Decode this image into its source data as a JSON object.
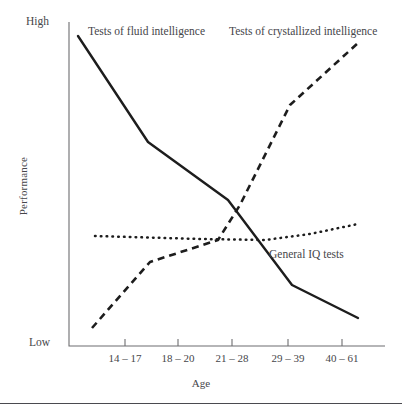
{
  "chart_data": {
    "type": "line",
    "title": "",
    "xlabel": "Age",
    "ylabel": "Performance",
    "categories": [
      "14 – 17",
      "18 – 20",
      "21 – 28",
      "29 – 39",
      "40 – 61"
    ],
    "y_axis_ticks": [
      "High",
      "Low"
    ],
    "ylim": [
      0,
      100
    ],
    "grid": false,
    "legend": "inline-annotations",
    "series": [
      {
        "name": "Tests of fluid intelligence",
        "style": "solid",
        "color": "#1d1d1d",
        "annotation": "Tests of fluid intelligence",
        "values": [
          96,
          76,
          52,
          26,
          14
        ],
        "points": [
          {
            "x": 78,
            "y": 36
          },
          {
            "x": 148,
            "y": 142
          },
          {
            "x": 228,
            "y": 200
          },
          {
            "x": 292,
            "y": 285
          },
          {
            "x": 358,
            "y": 318
          }
        ]
      },
      {
        "name": "Tests of crystallized intelligence",
        "style": "dashed",
        "color": "#1d1d1d",
        "annotation": "Tests of crystallized intelligence",
        "values": [
          6,
          27,
          37,
          72,
          94
        ],
        "points": [
          {
            "x": 92,
            "y": 328
          },
          {
            "x": 150,
            "y": 262
          },
          {
            "x": 218,
            "y": 240
          },
          {
            "x": 240,
            "y": 205
          },
          {
            "x": 290,
            "y": 105
          },
          {
            "x": 358,
            "y": 43
          }
        ]
      },
      {
        "name": "General IQ tests",
        "style": "dotted",
        "color": "#1d1d1d",
        "annotation": "General IQ tests",
        "values": [
          45,
          45,
          44,
          45,
          50
        ],
        "points": [
          {
            "x": 95,
            "y": 236
          },
          {
            "x": 200,
            "y": 239
          },
          {
            "x": 265,
            "y": 240
          },
          {
            "x": 310,
            "y": 234
          },
          {
            "x": 358,
            "y": 224
          }
        ]
      }
    ],
    "axes": {
      "y_axis_x": 69,
      "y_axis_top": 22,
      "y_axis_bottom": 346,
      "x_axis_right": 385,
      "tick_positions_x": [
        125,
        178,
        232,
        288,
        342
      ]
    }
  }
}
